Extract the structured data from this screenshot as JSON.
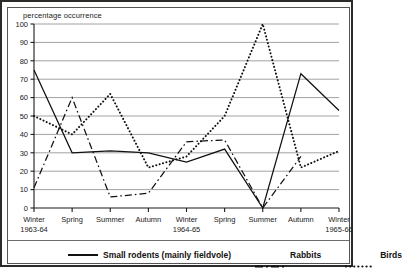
{
  "chart_data": {
    "type": "line",
    "title": "",
    "ylabel": "percentage occurrence",
    "xlabel": "",
    "ylim": [
      0,
      100
    ],
    "ytick_values": [
      0,
      10,
      20,
      30,
      40,
      50,
      60,
      70,
      80,
      90,
      100
    ],
    "ytick_labels": [
      "0",
      "10",
      "20",
      "30",
      "40",
      "50",
      "60",
      "70",
      "80",
      "90",
      "100"
    ],
    "grid": true,
    "legend_position": "bottom",
    "categories": [
      "Winter",
      "Spring",
      "Summer",
      "Autumn",
      "Winter",
      "Spring",
      "Summer",
      "Autumn",
      "Winter"
    ],
    "year_labels": [
      {
        "text": "1963-64",
        "at_index": 0
      },
      {
        "text": "1964-65",
        "at_index": 4
      },
      {
        "text": "1965-66",
        "at_index": 8
      }
    ],
    "series": [
      {
        "name": "Small rodents (mainly fieldvole)",
        "style": "solid",
        "values": [
          75,
          30,
          31,
          30,
          25,
          32,
          0,
          73,
          53
        ]
      },
      {
        "name": "Rabbits",
        "style": "dash-dot",
        "values": [
          11,
          60,
          6,
          8,
          36,
          37,
          0,
          28,
          null
        ]
      },
      {
        "name": "Birds",
        "style": "dotted",
        "values": [
          50,
          40,
          62,
          22,
          28,
          50,
          100,
          22,
          31
        ]
      }
    ]
  },
  "legend": {
    "items": [
      {
        "label": "Small rodents (mainly fieldvole)",
        "style": "solid"
      },
      {
        "label": "Rabbits",
        "style": "dash-dot"
      },
      {
        "label": "Birds",
        "style": "dotted"
      }
    ]
  },
  "colors": {
    "ink": "#111111",
    "grid": "#8a8a8a",
    "frame": "#2b2b2b",
    "background": "#ffffff"
  }
}
